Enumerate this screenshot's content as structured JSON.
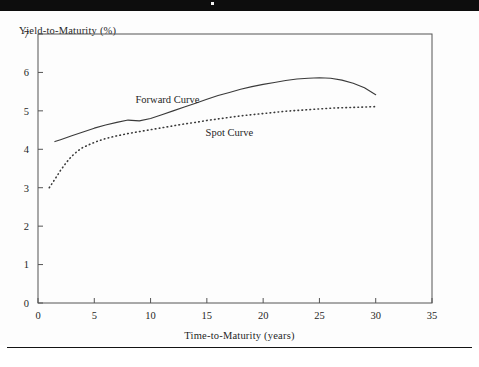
{
  "figure": {
    "header_bar_color": "#0d0d0d",
    "background_color": "#fdfdfd",
    "axis_color": "#4a4a4a",
    "curve_color": "#3a3a3a"
  },
  "chart_data": {
    "type": "line",
    "title": "",
    "xlabel": "Time-to-Maturity (years)",
    "ylabel": "Yield-to-Maturity (%)",
    "xlim": [
      0,
      35
    ],
    "ylim": [
      0,
      7
    ],
    "xticks": [
      0,
      5,
      10,
      15,
      20,
      25,
      30,
      35
    ],
    "xtick_labels": [
      "0",
      "5",
      "10",
      "15",
      "20",
      "25",
      "30",
      "35"
    ],
    "yticks": [
      0,
      1,
      2,
      3,
      4,
      5,
      6,
      7
    ],
    "ytick_labels": [
      "0",
      "1",
      "2",
      "3",
      "4",
      "5",
      "6",
      "7"
    ],
    "grid": false,
    "legend_position": "inline-annotations",
    "series": [
      {
        "name": "Forward Curve",
        "style": "solid",
        "label_x": 11.5,
        "label_y": 5.3,
        "x": [
          1.5,
          2,
          3,
          4,
          5,
          6,
          7,
          8,
          9,
          10,
          11,
          12,
          13,
          14,
          15,
          16,
          17,
          18,
          19,
          20,
          21,
          22,
          23,
          24,
          25,
          26,
          27,
          28,
          29,
          30
        ],
        "y": [
          4.2,
          4.25,
          4.35,
          4.45,
          4.55,
          4.63,
          4.7,
          4.76,
          4.74,
          4.8,
          4.9,
          5.0,
          5.1,
          5.2,
          5.3,
          5.4,
          5.48,
          5.56,
          5.63,
          5.69,
          5.74,
          5.79,
          5.83,
          5.85,
          5.86,
          5.85,
          5.8,
          5.72,
          5.6,
          5.42
        ]
      },
      {
        "name": "Spot Curve",
        "style": "dotted",
        "label_x": 17.0,
        "label_y": 4.45,
        "x": [
          1,
          1.5,
          2,
          2.5,
          3,
          3.5,
          4,
          5,
          6,
          7,
          8,
          9,
          10,
          11,
          12,
          13,
          14,
          15,
          16,
          17,
          18,
          19,
          20,
          21,
          22,
          23,
          24,
          25,
          26,
          27,
          28,
          29,
          30
        ],
        "y": [
          3.0,
          3.22,
          3.45,
          3.65,
          3.82,
          3.95,
          4.05,
          4.18,
          4.28,
          4.35,
          4.41,
          4.46,
          4.51,
          4.56,
          4.61,
          4.66,
          4.7,
          4.75,
          4.79,
          4.83,
          4.87,
          4.9,
          4.93,
          4.96,
          4.99,
          5.01,
          5.03,
          5.05,
          5.07,
          5.08,
          5.09,
          5.1,
          5.11
        ]
      }
    ]
  }
}
